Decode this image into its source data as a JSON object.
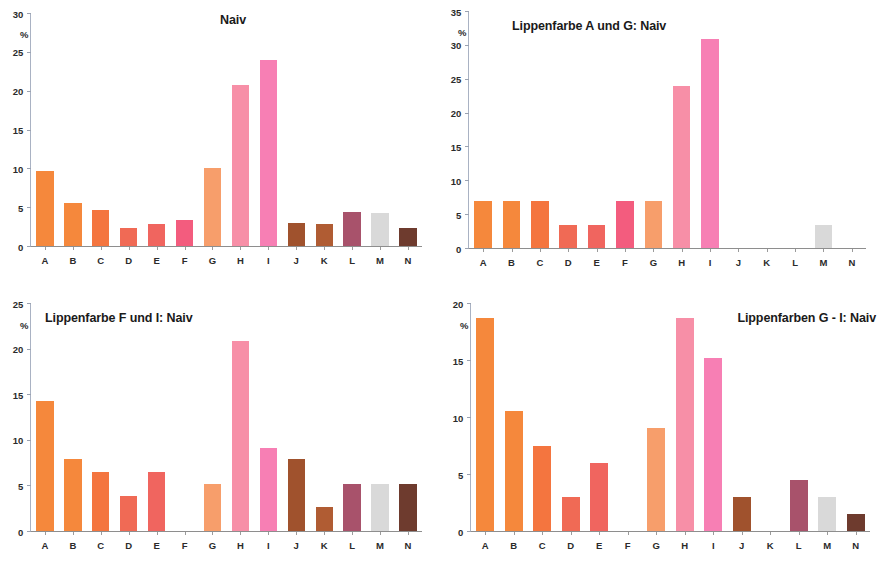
{
  "figure": {
    "panel_count": 4,
    "categories": [
      "A",
      "B",
      "C",
      "D",
      "E",
      "F",
      "G",
      "H",
      "I",
      "J",
      "K",
      "L",
      "M",
      "N"
    ],
    "bar_colors": {
      "A": "#F5883C",
      "B": "#F5883C",
      "C": "#F4753F",
      "D": "#F06A55",
      "E": "#F0655F",
      "F": "#F35C7E",
      "G": "#F79E6B",
      "H": "#F78FA7",
      "I": "#F77FB4",
      "J": "#A0522D",
      "K": "#B05C33",
      "L": "#A8526B",
      "M": "#D9D9D9",
      "N": "#6E3B2E"
    },
    "axis_unit_label": "%"
  },
  "chart_data": [
    {
      "id": "panel-top-left",
      "type": "bar",
      "title": "Naiv",
      "title_align": "center",
      "xlabel": "",
      "ylabel": "%",
      "ylim": [
        0,
        30
      ],
      "yticks": [
        0,
        5,
        10,
        15,
        20,
        25,
        30
      ],
      "grid": false,
      "legend": "none",
      "categories": [
        "A",
        "B",
        "C",
        "D",
        "E",
        "F",
        "G",
        "H",
        "I",
        "J",
        "K",
        "L",
        "M",
        "N"
      ],
      "values": [
        9.7,
        5.5,
        4.6,
        2.3,
        2.8,
        3.4,
        10.1,
        20.8,
        24.1,
        3.0,
        2.8,
        4.4,
        4.3,
        2.3
      ]
    },
    {
      "id": "panel-top-right",
      "type": "bar",
      "title": "Lippenfarbe A und G: Naiv",
      "title_align": "left",
      "xlabel": "",
      "ylabel": "%",
      "ylim": [
        0,
        35
      ],
      "yticks": [
        0,
        5,
        10,
        15,
        20,
        25,
        30,
        35
      ],
      "grid": false,
      "legend": "none",
      "categories": [
        "A",
        "B",
        "C",
        "D",
        "E",
        "F",
        "G",
        "H",
        "I",
        "J",
        "K",
        "L",
        "M",
        "N"
      ],
      "values": [
        6.9,
        6.9,
        6.9,
        3.4,
        3.4,
        6.9,
        6.9,
        24.1,
        31.0,
        0,
        0,
        0,
        3.4,
        0
      ]
    },
    {
      "id": "panel-bottom-left",
      "type": "bar",
      "title": "Lippenfarbe F und I: Naiv",
      "title_align": "left",
      "xlabel": "",
      "ylabel": "%",
      "ylim": [
        0,
        25
      ],
      "yticks": [
        0,
        5,
        10,
        15,
        20,
        25
      ],
      "grid": false,
      "legend": "none",
      "categories": [
        "A",
        "B",
        "C",
        "D",
        "E",
        "F",
        "G",
        "H",
        "I",
        "J",
        "K",
        "L",
        "M",
        "N"
      ],
      "values": [
        14.3,
        7.9,
        6.5,
        3.9,
        6.5,
        0,
        5.2,
        20.9,
        9.1,
        7.9,
        2.6,
        5.2,
        5.2,
        5.2
      ]
    },
    {
      "id": "panel-bottom-right",
      "type": "bar",
      "title": "Lippenfarben G - I: Naiv",
      "title_align": "right",
      "xlabel": "",
      "ylabel": "%",
      "ylim": [
        0,
        20
      ],
      "yticks": [
        0,
        5,
        10,
        15,
        20
      ],
      "grid": false,
      "legend": "none",
      "categories": [
        "A",
        "B",
        "C",
        "D",
        "E",
        "F",
        "G",
        "H",
        "I",
        "J",
        "K",
        "L",
        "M",
        "N"
      ],
      "values": [
        18.8,
        10.6,
        7.5,
        3.0,
        6.0,
        0,
        9.1,
        18.8,
        15.2,
        3.0,
        0,
        4.5,
        3.0,
        1.5
      ]
    }
  ]
}
